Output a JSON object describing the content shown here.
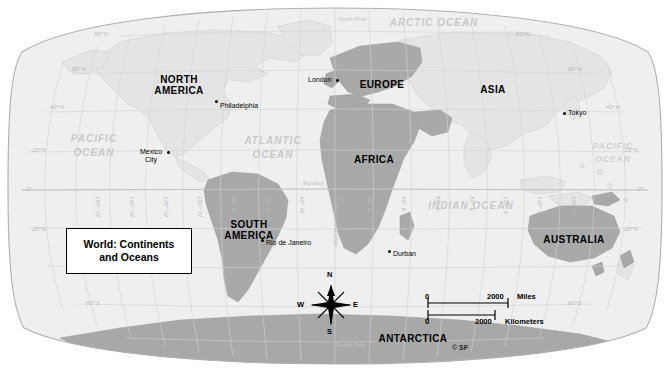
{
  "map": {
    "title_line1": "World: Continents",
    "title_line2": "and Oceans",
    "projection_note": "Robinson-style oval world map",
    "copyright": "© SF",
    "colors": {
      "land_light": "#e3e3e3",
      "land_dark": "#a8a8a8",
      "ocean": "#f0f0f0",
      "graticule": "#cfcfcf",
      "border": "#b5b5b5",
      "text_dark": "#000000",
      "text_ocean": "#c9c9c9"
    }
  },
  "continents": [
    {
      "name": "NORTH\nAMERICA",
      "line1": "NORTH",
      "line2": "AMERICA",
      "x": 178,
      "y": 80
    },
    {
      "name": "SOUTH AMERICA",
      "line1": "SOUTH",
      "line2": "AMERICA",
      "x": 250,
      "y": 222
    },
    {
      "name": "EUROPE",
      "line1": "EUROPE",
      "line2": "",
      "x": 382,
      "y": 83
    },
    {
      "name": "AFRICA",
      "line1": "AFRICA",
      "line2": "",
      "x": 373,
      "y": 158
    },
    {
      "name": "ASIA",
      "line1": "ASIA",
      "line2": "",
      "x": 492,
      "y": 88
    },
    {
      "name": "AUSTRALIA",
      "line1": "AUSTRALIA",
      "line2": "",
      "x": 573,
      "y": 238
    },
    {
      "name": "ANTARCTICA",
      "line1": "ANTARCTICA",
      "line2": "",
      "x": 412,
      "y": 338
    }
  ],
  "oceans": [
    {
      "label": "ARCTIC OCEAN",
      "x": 432,
      "y": 22
    },
    {
      "label": "PACIFIC",
      "x": 93,
      "y": 138
    },
    {
      "label": "OCEAN",
      "x": 93,
      "y": 152
    },
    {
      "label": "ATLANTIC",
      "x": 272,
      "y": 140
    },
    {
      "label": "OCEAN",
      "x": 272,
      "y": 154
    },
    {
      "label": "PACIFIC",
      "x": 612,
      "y": 145
    },
    {
      "label": "OCEAN",
      "x": 612,
      "y": 158
    },
    {
      "label": "INDIAN OCEAN",
      "x": 471,
      "y": 205
    }
  ],
  "cities": [
    {
      "name": "Philadelphia",
      "dot_x": 216,
      "dot_y": 101,
      "lx": 220,
      "ly": 102,
      "align": "left"
    },
    {
      "name": "Mexico\nCity",
      "line1": "Mexico",
      "line2": "City",
      "dot_x": 168,
      "dot_y": 152,
      "lx": 136,
      "ly": 148,
      "align": "left"
    },
    {
      "name": "London",
      "dot_x": 337,
      "dot_y": 80,
      "lx": 308,
      "ly": 77,
      "align": "left"
    },
    {
      "name": "Tokyo",
      "dot_x": 564,
      "dot_y": 113,
      "lx": 568,
      "ly": 110,
      "align": "left"
    },
    {
      "name": "Rio de Janeiro",
      "dot_x": 262,
      "dot_y": 240,
      "lx": 266,
      "ly": 240,
      "align": "left"
    },
    {
      "name": "Durban",
      "dot_x": 389,
      "dot_y": 251,
      "lx": 393,
      "ly": 251,
      "align": "left"
    }
  ],
  "graticule": {
    "latitude_labels_left": [
      {
        "text": "80°N",
        "x": 94,
        "y": 34
      },
      {
        "text": "60°N",
        "x": 76,
        "y": 87
      },
      {
        "text": "40°N",
        "x": 53,
        "y": 106
      },
      {
        "text": "20°N",
        "x": 41,
        "y": 149
      },
      {
        "text": "0°",
        "x": 30,
        "y": 190
      },
      {
        "text": "20°S",
        "x": 36,
        "y": 230
      },
      {
        "text": "60°S",
        "x": 90,
        "y": 312
      }
    ],
    "latitude_labels_right": [
      {
        "text": "80°N",
        "x": 513,
        "y": 34
      },
      {
        "text": "60°N",
        "x": 565,
        "y": 88
      },
      {
        "text": "40°N",
        "x": 610,
        "y": 107
      },
      {
        "text": "20°N",
        "x": 627,
        "y": 148
      },
      {
        "text": "0°",
        "x": 639,
        "y": 190
      },
      {
        "text": "20°S",
        "x": 629,
        "y": 230
      },
      {
        "text": "60°S",
        "x": 570,
        "y": 312
      }
    ],
    "longitude_labels": [
      {
        "text": "160° W",
        "x": 104,
        "y": 196
      },
      {
        "text": "140° W",
        "x": 138,
        "y": 196
      },
      {
        "text": "120° W",
        "x": 172,
        "y": 196
      },
      {
        "text": "100° W",
        "x": 206,
        "y": 196
      },
      {
        "text": "80° W",
        "x": 240,
        "y": 196
      },
      {
        "text": "60° W",
        "x": 274,
        "y": 196
      },
      {
        "text": "40° W",
        "x": 308,
        "y": 196
      },
      {
        "text": "0° Prime Meridian",
        "x": 342,
        "y": 196
      },
      {
        "text": "20° E",
        "x": 376,
        "y": 196
      },
      {
        "text": "40° E",
        "x": 410,
        "y": 196
      },
      {
        "text": "60° E",
        "x": 444,
        "y": 196
      },
      {
        "text": "80° E",
        "x": 478,
        "y": 196
      },
      {
        "text": "100° E",
        "x": 512,
        "y": 196
      },
      {
        "text": "120° E",
        "x": 546,
        "y": 196
      },
      {
        "text": "140° E",
        "x": 580,
        "y": 196
      }
    ],
    "special_labels": [
      {
        "text": "North Pole",
        "x": 339,
        "y": 20
      },
      {
        "text": "South Pole",
        "x": 338,
        "y": 345
      },
      {
        "text": "Equator",
        "x": 304,
        "y": 182
      }
    ]
  },
  "compass": {
    "north": "N",
    "south": "S",
    "east": "E",
    "west": "W"
  },
  "scale": {
    "miles_zero": "0",
    "miles_value": "2000",
    "miles_unit": "Miles",
    "km_zero": "0",
    "km_value": "2000",
    "km_unit": "Kilometers"
  }
}
